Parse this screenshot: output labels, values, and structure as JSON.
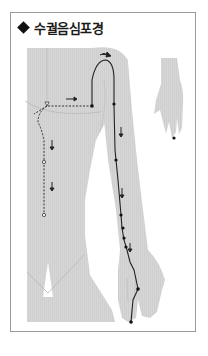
{
  "title": "수궐음심포경",
  "title_bullet": "diamond",
  "figure": {
    "colors": {
      "body_fill": "#d4d4d4",
      "outline": "#a8a8a8",
      "meridian_line": "#222222",
      "point": "#111111",
      "frame_border": "#9a9a9a"
    },
    "inset": "back of hand with point marker"
  }
}
